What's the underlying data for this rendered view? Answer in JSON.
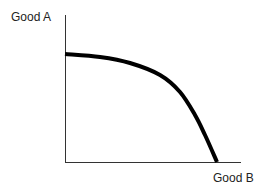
{
  "chart_data": {
    "type": "line",
    "title": "",
    "xlabel": "Good B",
    "ylabel": "Good A",
    "grid": false,
    "legend": null,
    "ticks": {
      "x": [],
      "y": []
    },
    "series": [
      {
        "name": "Production Possibilities Frontier",
        "description": "Concave (bowed-out) curve from y-axis intercept to x-axis intercept",
        "color": "#000000",
        "points_px": [
          [
            65,
            54
          ],
          [
            100,
            57
          ],
          [
            130,
            63
          ],
          [
            160,
            75
          ],
          [
            180,
            92
          ],
          [
            195,
            115
          ],
          [
            205,
            135
          ],
          [
            217,
            162
          ]
        ]
      }
    ],
    "axes": {
      "origin_px": [
        65,
        162
      ],
      "y_axis_top_px": [
        65,
        15
      ],
      "x_axis_end_px": [
        241,
        162
      ],
      "color": "#333333"
    }
  },
  "labels": {
    "y_axis": "Good A",
    "x_axis": "Good B"
  }
}
